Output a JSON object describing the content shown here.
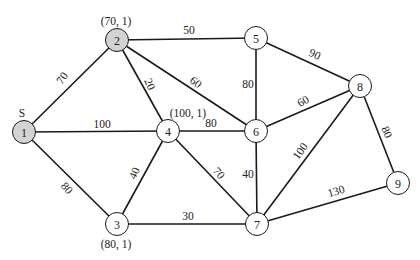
{
  "diagram": {
    "type": "weighted-graph",
    "colors": {
      "edge": "#1a1a1a",
      "visited_fill": "#d3d3d3",
      "unvisited_fill": "#ffffff"
    },
    "nodes": [
      {
        "id": "1",
        "label": "1",
        "x": 24,
        "y": 132,
        "visited": true,
        "annotation": "S",
        "ax": 22,
        "ay": 113
      },
      {
        "id": "2",
        "label": "2",
        "x": 117,
        "y": 40,
        "visited": true,
        "annotation": "(70, 1)",
        "ax": 116,
        "ay": 21
      },
      {
        "id": "3",
        "label": "3",
        "x": 117,
        "y": 224,
        "visited": false,
        "annotation": "(80, 1)",
        "ax": 116,
        "ay": 244
      },
      {
        "id": "4",
        "label": "4",
        "x": 168,
        "y": 131,
        "visited": false,
        "annotation": "(100, 1)",
        "ax": 188,
        "ay": 113
      },
      {
        "id": "5",
        "label": "5",
        "x": 256,
        "y": 38,
        "visited": false,
        "annotation": "",
        "ax": 0,
        "ay": 0
      },
      {
        "id": "6",
        "label": "6",
        "x": 256,
        "y": 131,
        "visited": false,
        "annotation": "",
        "ax": 0,
        "ay": 0
      },
      {
        "id": "7",
        "label": "7",
        "x": 257,
        "y": 224,
        "visited": false,
        "annotation": "",
        "ax": 0,
        "ay": 0
      },
      {
        "id": "8",
        "label": "8",
        "x": 360,
        "y": 86,
        "visited": false,
        "annotation": "",
        "ax": 0,
        "ay": 0
      },
      {
        "id": "9",
        "label": "9",
        "x": 398,
        "y": 183,
        "visited": false,
        "annotation": "",
        "ax": 0,
        "ay": 0
      }
    ],
    "edges": [
      {
        "from": "1",
        "to": "2",
        "weight": "70",
        "lx": 62,
        "ly": 78,
        "rot": -55
      },
      {
        "from": "1",
        "to": "4",
        "weight": "100",
        "lx": 102,
        "ly": 124,
        "rot": 0
      },
      {
        "from": "1",
        "to": "3",
        "weight": "80",
        "lx": 67,
        "ly": 188,
        "rot": 50
      },
      {
        "from": "2",
        "to": "5",
        "weight": "50",
        "lx": 189,
        "ly": 30,
        "rot": 0
      },
      {
        "from": "2",
        "to": "4",
        "weight": "20",
        "lx": 150,
        "ly": 84,
        "rot": 65
      },
      {
        "from": "2",
        "to": "6",
        "weight": "60",
        "lx": 196,
        "ly": 82,
        "rot": 37
      },
      {
        "from": "4",
        "to": "6",
        "weight": "80",
        "lx": 211,
        "ly": 123,
        "rot": 0
      },
      {
        "from": "4",
        "to": "3",
        "weight": "40",
        "lx": 134,
        "ly": 173,
        "rot": -65
      },
      {
        "from": "4",
        "to": "7",
        "weight": "70",
        "lx": 219,
        "ly": 173,
        "rot": 50
      },
      {
        "from": "3",
        "to": "7",
        "weight": "30",
        "lx": 188,
        "ly": 216,
        "rot": 0
      },
      {
        "from": "5",
        "to": "6",
        "weight": "80",
        "lx": 248,
        "ly": 84,
        "rot": 0
      },
      {
        "from": "5",
        "to": "8",
        "weight": "90",
        "lx": 315,
        "ly": 54,
        "rot": 25
      },
      {
        "from": "6",
        "to": "8",
        "weight": "60",
        "lx": 303,
        "ly": 101,
        "rot": -30
      },
      {
        "from": "6",
        "to": "7",
        "weight": "40",
        "lx": 248,
        "ly": 174,
        "rot": 0
      },
      {
        "from": "8",
        "to": "7",
        "weight": "100",
        "lx": 300,
        "ly": 151,
        "rot": -55
      },
      {
        "from": "8",
        "to": "9",
        "weight": "80",
        "lx": 387,
        "ly": 132,
        "rot": 65
      },
      {
        "from": "7",
        "to": "9",
        "weight": "130",
        "lx": 336,
        "ly": 191,
        "rot": -17
      }
    ]
  }
}
